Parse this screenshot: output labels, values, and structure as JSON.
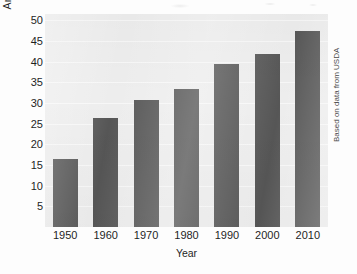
{
  "chart_data": {
    "type": "bar",
    "title": "",
    "subtitle": "",
    "xlabel": "Year",
    "ylabel": "Annual yield (bushels per acre)",
    "categories": [
      "1950",
      "1960",
      "1970",
      "1980",
      "1990",
      "2000",
      "2010"
    ],
    "values": [
      16.4,
      26.3,
      30.7,
      33.4,
      39.3,
      41.9,
      47.4
    ],
    "series": [
      {
        "name": "Annual yield",
        "values": [
          16.4,
          26.3,
          30.7,
          33.4,
          39.3,
          41.9,
          47.4
        ]
      }
    ],
    "ylim": [
      0,
      51.5
    ],
    "xlim_note": "categorical",
    "yticks": [
      5,
      10,
      15,
      20,
      25,
      30,
      35,
      40,
      45,
      50
    ],
    "ytick_labels": [
      "5",
      "10",
      "15",
      "20",
      "25",
      "30",
      "35",
      "40",
      "45",
      "50"
    ],
    "grid": true,
    "grid_axis": "y",
    "legend": false,
    "legend_position": "none",
    "annotations": [
      {
        "name": "source-note",
        "text": "Based on data from USDA",
        "position": "right-margin",
        "rotation": 90
      }
    ],
    "colors": {
      "bar": "#565656",
      "plot_background": "#ededed",
      "gridline": "#f7f7f7",
      "figure_background": "#fdfdfd",
      "text": "#1f1f1f"
    }
  }
}
